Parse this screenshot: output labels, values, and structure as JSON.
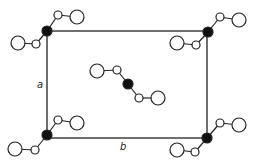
{
  "diagram": {
    "type": "unit-cell-projection",
    "colors": {
      "line": "#222222",
      "open_fill": "#ffffff",
      "solid_fill": "#111111"
    },
    "cell": {
      "x1": 47,
      "y1": 31,
      "x2": 207,
      "y2": 138
    },
    "axis_labels": {
      "a": {
        "text": "a",
        "x": 37,
        "y": 88
      },
      "b": {
        "text": "b",
        "x": 120,
        "y": 150
      }
    },
    "molecules": [
      {
        "name": "top-left",
        "atoms": [
          {
            "x": 18,
            "y": 43,
            "r": 7,
            "k": "open"
          },
          {
            "x": 36,
            "y": 44,
            "r": 4,
            "k": "open"
          },
          {
            "x": 47,
            "y": 31,
            "r": 5,
            "k": "solid"
          },
          {
            "x": 58,
            "y": 15,
            "r": 4,
            "k": "open"
          },
          {
            "x": 77,
            "y": 17,
            "r": 7,
            "k": "open"
          }
        ]
      },
      {
        "name": "top-right",
        "atoms": [
          {
            "x": 177,
            "y": 43,
            "r": 7,
            "k": "open"
          },
          {
            "x": 196,
            "y": 45,
            "r": 4,
            "k": "open"
          },
          {
            "x": 208,
            "y": 32,
            "r": 5,
            "k": "solid"
          },
          {
            "x": 220,
            "y": 17,
            "r": 4,
            "k": "open"
          },
          {
            "x": 239,
            "y": 20,
            "r": 7,
            "k": "open"
          }
        ]
      },
      {
        "name": "center",
        "atoms": [
          {
            "x": 97,
            "y": 71,
            "r": 7,
            "k": "open"
          },
          {
            "x": 117,
            "y": 70,
            "r": 4,
            "k": "open"
          },
          {
            "x": 128,
            "y": 84,
            "r": 5,
            "k": "solid"
          },
          {
            "x": 139,
            "y": 98,
            "r": 4,
            "k": "open"
          },
          {
            "x": 158,
            "y": 98,
            "r": 7,
            "k": "open"
          }
        ]
      },
      {
        "name": "bottom-left",
        "atoms": [
          {
            "x": 15,
            "y": 149,
            "r": 7,
            "k": "open"
          },
          {
            "x": 35,
            "y": 150,
            "r": 4,
            "k": "open"
          },
          {
            "x": 47,
            "y": 135,
            "r": 5,
            "k": "solid"
          },
          {
            "x": 58,
            "y": 120,
            "r": 4,
            "k": "open"
          },
          {
            "x": 77,
            "y": 123,
            "r": 7,
            "k": "open"
          }
        ]
      },
      {
        "name": "bottom-right",
        "atoms": [
          {
            "x": 177,
            "y": 150,
            "r": 7,
            "k": "open"
          },
          {
            "x": 195,
            "y": 152,
            "r": 4,
            "k": "open"
          },
          {
            "x": 207,
            "y": 138,
            "r": 5,
            "k": "solid"
          },
          {
            "x": 220,
            "y": 123,
            "r": 4,
            "k": "open"
          },
          {
            "x": 239,
            "y": 125,
            "r": 7,
            "k": "open"
          }
        ]
      }
    ]
  }
}
